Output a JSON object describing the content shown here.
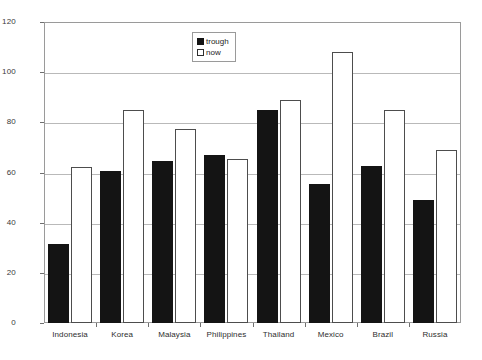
{
  "chart_data": {
    "type": "bar",
    "title": "",
    "subtitle": "",
    "xlabel": "",
    "ylabel": "",
    "categories": [
      "Indonesia",
      "Korea",
      "Malaysia",
      "Philippines",
      "Thailand",
      "Mexico",
      "Brazil",
      "Russia"
    ],
    "series": [
      {
        "name": "trough",
        "color": "#141414",
        "style": "filled",
        "values": [
          31.5,
          60.5,
          64.5,
          67.0,
          85.0,
          55.5,
          62.5,
          49.0
        ]
      },
      {
        "name": "now",
        "color": "#ffffff",
        "style": "hollow",
        "values": [
          62.0,
          85.0,
          77.5,
          65.5,
          89.0,
          108.0,
          85.0,
          69.0
        ]
      }
    ],
    "ylim": [
      0,
      120
    ],
    "yticks": [
      0,
      20,
      40,
      60,
      80,
      100,
      120
    ],
    "ytick_labels": [
      "0",
      "20",
      "40",
      "60",
      "80",
      "100",
      "120"
    ],
    "grid": true,
    "grid_axis": "y",
    "legend": {
      "position": "upper-center-right",
      "entries": [
        {
          "label": "trough",
          "swatch": "filled"
        },
        {
          "label": "now",
          "swatch": "hollow"
        }
      ]
    }
  }
}
